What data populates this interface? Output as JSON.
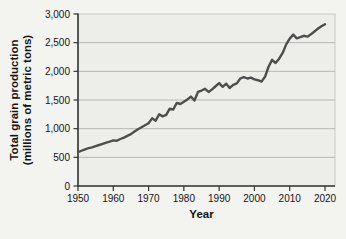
{
  "figure": {
    "page_background": "#f3f3f0",
    "plot_background": "#edeeea",
    "frame_color": "#c9c9c5",
    "grid_color": "#b7b7b3",
    "axis_color": "#333333",
    "line_color": "#4e4e4e",
    "text_color": "#141414"
  },
  "chart_data": {
    "type": "line",
    "title": "",
    "xlabel": "Year",
    "ylabel": "Total grain production (millions of metric tons)",
    "ylabel_lines": [
      "Total grain production",
      "(millions of metric tons)"
    ],
    "xlim": [
      1950,
      2020
    ],
    "ylim": [
      0,
      3000
    ],
    "grid": "horizontal",
    "legend": "none",
    "x_ticks": [
      1950,
      1960,
      1970,
      1980,
      1990,
      2000,
      2010,
      2020
    ],
    "x_tick_labels": [
      "1950",
      "1960",
      "1970",
      "1980",
      "1990",
      "2000",
      "2010",
      "2020"
    ],
    "y_ticks": [
      0,
      500,
      1000,
      1500,
      2000,
      2500,
      3000
    ],
    "y_tick_labels": [
      "0",
      "500",
      "1,000",
      "1,500",
      "2,000",
      "2,500",
      "3,000"
    ],
    "series": [
      {
        "name": "World total grain production",
        "x": [
          1950,
          1951,
          1952,
          1953,
          1954,
          1955,
          1956,
          1957,
          1958,
          1959,
          1960,
          1961,
          1962,
          1963,
          1964,
          1965,
          1966,
          1967,
          1968,
          1969,
          1970,
          1971,
          1972,
          1973,
          1974,
          1975,
          1976,
          1977,
          1978,
          1979,
          1980,
          1981,
          1982,
          1983,
          1984,
          1985,
          1986,
          1987,
          1988,
          1989,
          1990,
          1991,
          1992,
          1993,
          1994,
          1995,
          1996,
          1997,
          1998,
          1999,
          2000,
          2001,
          2002,
          2003,
          2004,
          2005,
          2006,
          2007,
          2008,
          2009,
          2010,
          2011,
          2012,
          2013,
          2014,
          2015,
          2016,
          2017,
          2018,
          2019,
          2020
        ],
        "y": [
          590,
          615,
          640,
          660,
          675,
          695,
          715,
          735,
          755,
          775,
          795,
          790,
          820,
          845,
          875,
          905,
          950,
          990,
          1025,
          1060,
          1095,
          1180,
          1140,
          1250,
          1215,
          1240,
          1350,
          1335,
          1450,
          1430,
          1470,
          1510,
          1560,
          1490,
          1640,
          1665,
          1695,
          1640,
          1685,
          1740,
          1795,
          1730,
          1785,
          1710,
          1765,
          1790,
          1875,
          1900,
          1875,
          1890,
          1860,
          1845,
          1820,
          1905,
          2080,
          2200,
          2145,
          2220,
          2320,
          2470,
          2570,
          2640,
          2575,
          2595,
          2620,
          2605,
          2645,
          2695,
          2745,
          2785,
          2820
        ]
      }
    ]
  }
}
